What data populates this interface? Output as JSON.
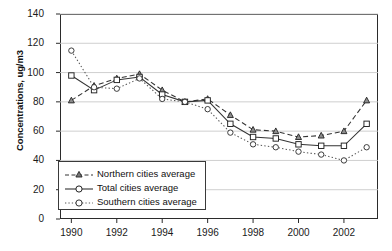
{
  "chart_data": {
    "type": "line",
    "title": "",
    "xlabel": "",
    "ylabel": "Concentrations, ug/m3",
    "x": [
      1990,
      1991,
      1992,
      1993,
      1994,
      1995,
      1996,
      1997,
      1998,
      1999,
      2000,
      2001,
      2002,
      2003
    ],
    "xlim": [
      1989.5,
      2003.5
    ],
    "ylim": [
      0,
      140
    ],
    "yticks": [
      0,
      20,
      40,
      60,
      80,
      100,
      120,
      140
    ],
    "xticks": [
      1990,
      1992,
      1994,
      1996,
      1998,
      2000,
      2002
    ],
    "xtick_labels": [
      "1990",
      "1992",
      "1994",
      "1996",
      "1998",
      "2000",
      "2002"
    ],
    "ytick_labels": [
      "0",
      "20",
      "40",
      "60",
      "80",
      "100",
      "120",
      "140"
    ],
    "grid": "horizontal",
    "legend_position": "lower-left-inside",
    "series": [
      {
        "name": "Northern cities average",
        "marker": "triangle",
        "line_style": "dashed",
        "color": "#333333",
        "values": [
          81,
          91,
          96,
          99,
          88,
          80,
          82,
          71,
          61,
          60,
          56,
          57,
          60,
          81
        ]
      },
      {
        "name": "Total cities average",
        "marker": "square",
        "line_style": "solid",
        "color": "#333333",
        "values": [
          98,
          88,
          95,
          97,
          85,
          80,
          81,
          65,
          56,
          55,
          51,
          50,
          50,
          65
        ]
      },
      {
        "name": "Southern cities average",
        "marker": "circle",
        "line_style": "dotted",
        "color": "#555555",
        "values": [
          115,
          90,
          89,
          96,
          82,
          80,
          75,
          59,
          51,
          49,
          46,
          44,
          40,
          49
        ]
      }
    ]
  },
  "legend": {
    "items": [
      {
        "label": "Northern cities average"
      },
      {
        "label": "Total cities average"
      },
      {
        "label": "Southern cities average"
      }
    ]
  }
}
